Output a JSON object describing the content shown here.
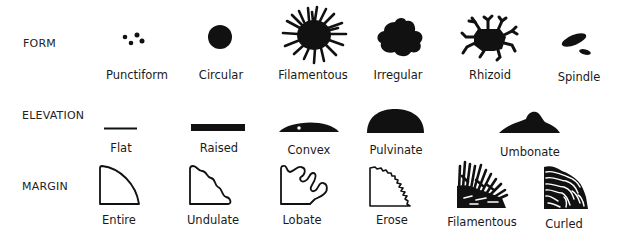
{
  "rows": {
    "form": {
      "label": "FORM",
      "items": [
        {
          "name": "Punctiform"
        },
        {
          "name": "Circular"
        },
        {
          "name": "Filamentous"
        },
        {
          "name": "Irregular"
        },
        {
          "name": "Rhizoid"
        },
        {
          "name": "Spindle"
        }
      ]
    },
    "elevation": {
      "label": "ELEVATION",
      "items": [
        {
          "name": "Flat"
        },
        {
          "name": "Raised"
        },
        {
          "name": "Convex"
        },
        {
          "name": "Pulvinate"
        },
        {
          "name": "Umbonate"
        }
      ]
    },
    "margin": {
      "label": "MARGIN",
      "items": [
        {
          "name": "Entire"
        },
        {
          "name": "Undulate"
        },
        {
          "name": "Lobate"
        },
        {
          "name": "Erose"
        },
        {
          "name": "Filamentous"
        },
        {
          "name": "Curled"
        }
      ]
    }
  },
  "colors": {
    "ink": "#111111",
    "background": "#ffffff"
  }
}
